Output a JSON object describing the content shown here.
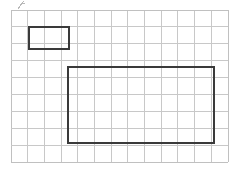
{
  "figure": {
    "canvas": {
      "width": 239,
      "height": 171,
      "background": "#ffffff"
    }
  },
  "grid": {
    "name": "square-grid",
    "columns": 13,
    "rows": 9,
    "left": 11,
    "top": 10,
    "right": 228,
    "bottom": 162,
    "cell_width": 16.7,
    "cell_height": 16.9,
    "line_color": "#c8c8c8",
    "line_width": 1,
    "border_color": "#c0c0c0"
  },
  "shapes": [
    {
      "name": "small-rectangle",
      "type": "rectangle",
      "x": 29,
      "y": 27,
      "width": 40,
      "height": 22,
      "grid_columns": 2,
      "grid_rows": 1,
      "stroke": "#3a3a3a",
      "stroke_width": 2,
      "fill": "none"
    },
    {
      "name": "large-rectangle",
      "type": "rectangle",
      "x": 68,
      "y": 67,
      "width": 146,
      "height": 76,
      "grid_columns": 9,
      "grid_rows": 4,
      "stroke": "#3a3a3a",
      "stroke_width": 2,
      "fill": "none"
    }
  ],
  "marks": [
    {
      "name": "pencil-mark",
      "type": "stray-mark",
      "x": 18,
      "y": 1,
      "width": 7,
      "height": 8,
      "color": "#b8b8b8"
    }
  ]
}
